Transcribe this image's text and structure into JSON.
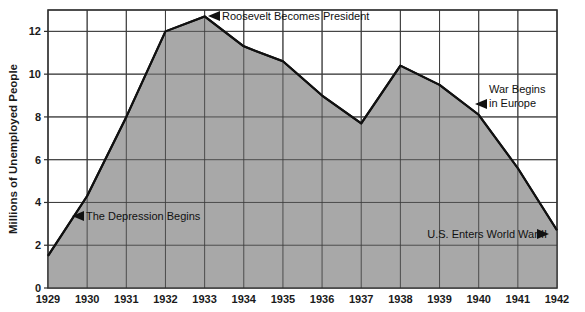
{
  "chart_data": {
    "type": "area",
    "title": "",
    "xlabel": "",
    "ylabel": "Millions of Unemployed People",
    "categories": [
      "1929",
      "1930",
      "1931",
      "1932",
      "1933",
      "1934",
      "1935",
      "1936",
      "1937",
      "1938",
      "1939",
      "1940",
      "1941",
      "1942"
    ],
    "values": [
      1.5,
      4.3,
      8.0,
      12.0,
      12.7,
      11.3,
      10.6,
      9.0,
      7.7,
      10.4,
      9.5,
      8.1,
      5.6,
      2.7
    ],
    "series": [
      {
        "name": "Unemployed People",
        "values": [
          1.5,
          4.3,
          8.0,
          12.0,
          12.7,
          11.3,
          10.6,
          9.0,
          7.7,
          10.4,
          9.5,
          8.1,
          5.6,
          2.7
        ]
      }
    ],
    "xlim": [
      1929,
      1942
    ],
    "ylim": [
      0,
      13
    ],
    "ytick_labels": [
      "0",
      "2",
      "4",
      "6",
      "8",
      "10",
      "12"
    ],
    "ytick_values": [
      0,
      2,
      4,
      6,
      8,
      10,
      12
    ],
    "xtick_labels": [
      "1929",
      "1930",
      "1931",
      "1932",
      "1933",
      "1934",
      "1935",
      "1936",
      "1937",
      "1938",
      "1939",
      "1940",
      "1941",
      "1942"
    ],
    "grid": true,
    "legend": "none",
    "fill_color": "#a8a8a8",
    "line_color": "#111111",
    "grid_color": "#4a4a4a",
    "background_color": "#ffffff",
    "annotations": [
      {
        "id": "roosevelt",
        "text": "Roosevelt Becomes President",
        "lines": [
          "Roosevelt Becomes President"
        ],
        "arrow": "left",
        "at_year": "1933",
        "at_value": 12.7
      },
      {
        "id": "depression",
        "text": "The Depression Begins",
        "lines": [
          "The Depression Begins"
        ],
        "arrow": "left",
        "at_year": "1930",
        "at_value": 3.6
      },
      {
        "id": "war-europe",
        "text": "War Begins in Europe",
        "lines": [
          "War Begins",
          "in Europe"
        ],
        "arrow": "left",
        "at_year": "1940",
        "at_value": 8.8
      },
      {
        "id": "us-enters-war",
        "text": "U.S. Enters World War II",
        "lines": [
          "U.S. Enters World War II"
        ],
        "arrow": "right",
        "at_year": "1942",
        "at_value": 2.6
      }
    ]
  }
}
